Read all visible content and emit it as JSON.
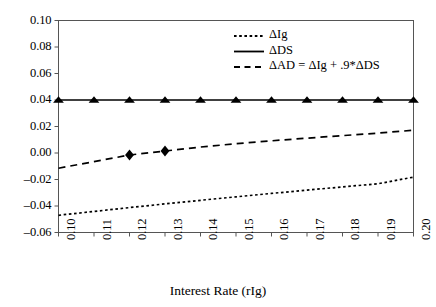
{
  "chart_data": {
    "type": "line",
    "title": "",
    "xlabel": "Interest Rate (rIg)",
    "ylabel": "",
    "x": [
      0.1,
      0.11,
      0.12,
      0.13,
      0.14,
      0.15,
      0.16,
      0.17,
      0.18,
      0.19,
      0.2
    ],
    "xtick_labels": [
      "0.10",
      "0.11",
      "0.12",
      "0.13",
      "0.14",
      "0.15",
      "0.16",
      "0.17",
      "0.18",
      "0.19",
      "0.20"
    ],
    "ytick_labels": [
      "0.10",
      "0.08",
      "0.06",
      "0.04",
      "0.02",
      "0.00",
      "–0.02",
      "–0.04",
      "–0.06"
    ],
    "ytick_values": [
      0.1,
      0.08,
      0.06,
      0.04,
      0.02,
      0.0,
      -0.02,
      -0.04,
      -0.06
    ],
    "xlim": [
      0.1,
      0.2
    ],
    "ylim": [
      -0.06,
      0.1
    ],
    "grid": false,
    "legend_position": "top-right",
    "series": [
      {
        "name": "ΔIg",
        "style": "dotted",
        "color": "#000000",
        "marker": "none",
        "values": [
          -0.047,
          -0.0441,
          -0.0412,
          -0.0384,
          -0.0357,
          -0.0331,
          -0.0305,
          -0.028,
          -0.0256,
          -0.0232,
          -0.0182
        ]
      },
      {
        "name": "ΔDS",
        "style": "solid",
        "color": "#000000",
        "marker": "triangle",
        "values": [
          0.04,
          0.04,
          0.04,
          0.04,
          0.04,
          0.04,
          0.04,
          0.04,
          0.04,
          0.04,
          0.04
        ]
      },
      {
        "name": "ΔAD = ΔIg + .9*ΔDS",
        "style": "dashed",
        "color": "#000000",
        "marker": "diamond",
        "marker_at": [
          0.12,
          0.13
        ],
        "values": [
          -0.0115,
          -0.0065,
          -0.0015,
          0.0015,
          0.0045,
          0.007,
          0.0092,
          0.0112,
          0.0131,
          0.015,
          0.0172
        ]
      }
    ]
  },
  "legend": {
    "entries": [
      {
        "label": "ΔIg",
        "style": "dotted"
      },
      {
        "label": "ΔDS",
        "style": "solid"
      },
      {
        "label": "ΔAD = ΔIg + .9*ΔDS",
        "style": "dashed"
      }
    ]
  }
}
